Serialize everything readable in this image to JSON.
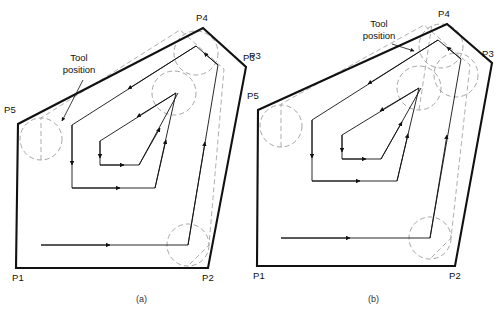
{
  "figure": {
    "title_caption_a": "(a)",
    "title_caption_b": "(b)",
    "background_color": "#ffffff",
    "line_color": "#111111",
    "dashed_circle_color": "#8a8a8a"
  },
  "diagram_a": {
    "caption": "(a)",
    "annotation": "Tool\nposition",
    "vertex_labels": {
      "p1": "P1",
      "p2": "P2",
      "p3": "P3",
      "p4": "P4",
      "p5": "P5"
    },
    "boundary_points": [
      {
        "name": "P1",
        "x": 16,
        "y": 268
      },
      {
        "name": "P2",
        "x": 208,
        "y": 268
      },
      {
        "name": "P3",
        "x": 246,
        "y": 67
      },
      {
        "name": "P4",
        "x": 203,
        "y": 28
      },
      {
        "name": "P5",
        "x": 18,
        "y": 124
      }
    ],
    "tool_circles": [
      {
        "cx": 41,
        "cy": 139,
        "r": 21
      },
      {
        "cx": 188,
        "cy": 245,
        "r": 21
      },
      {
        "cx": 196,
        "cy": 53,
        "r": 22
      },
      {
        "cx": 174,
        "cy": 93,
        "r": 22
      }
    ]
  },
  "diagram_b": {
    "caption": "(b)",
    "annotation": "Tool\nposition",
    "vertex_labels": {
      "p1": "P1",
      "p2": "P2",
      "p3": "P3",
      "p4": "P4",
      "p5": "P5"
    },
    "boundary_points": [
      {
        "name": "P1",
        "x": 257,
        "y": 266
      },
      {
        "name": "P2",
        "x": 455,
        "y": 266
      },
      {
        "name": "P3",
        "x": 492,
        "y": 63
      },
      {
        "name": "P4",
        "x": 447,
        "y": 24
      },
      {
        "name": "P5",
        "x": 258,
        "y": 110
      }
    ],
    "tool_circles": [
      {
        "cx": 281,
        "cy": 126,
        "r": 21
      },
      {
        "cx": 430,
        "cy": 238,
        "r": 21
      },
      {
        "cx": 441,
        "cy": 46,
        "r": 22
      },
      {
        "cx": 419,
        "cy": 88,
        "r": 22
      },
      {
        "cx": 456,
        "cy": 75,
        "r": 22
      }
    ]
  }
}
